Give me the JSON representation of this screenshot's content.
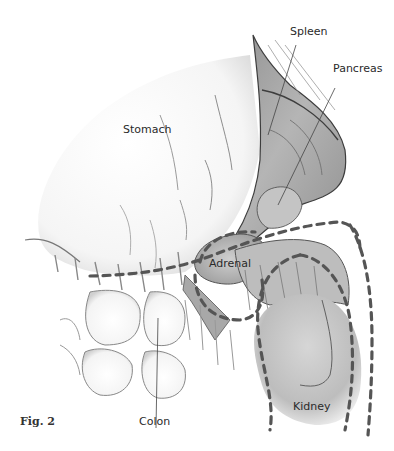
{
  "figure": {
    "caption": "Fig. 2",
    "labels": {
      "spleen": "Spleen",
      "pancreas": "Pancreas",
      "stomach": "Stomach",
      "adrenal": "Adrenal",
      "colon": "Colon",
      "kidney": "Kidney"
    },
    "colors": {
      "outline": "#4a4a4a",
      "dashed_line": "#555555",
      "shading_dark": "#6e6e6e",
      "shading_mid": "#a9a9a9",
      "shading_light": "#d8d8d8",
      "background": "#ffffff"
    }
  }
}
